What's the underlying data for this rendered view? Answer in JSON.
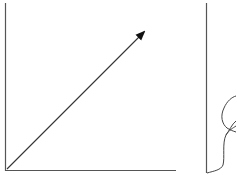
{
  "diagram": {
    "colors": {
      "axis": "#555555",
      "arrow": "#222222",
      "curve": "#444444",
      "background": "#ffffff"
    },
    "left_panel": {
      "y_axis": {
        "x": 5,
        "y1": 3,
        "y2": 171
      },
      "x_axis": {
        "y": 171,
        "x1": 5,
        "x2": 176
      },
      "vector_arrow": {
        "from": [
          7,
          169
        ],
        "to": [
          145,
          31
        ]
      }
    },
    "right_panel": {
      "vertical_line": {
        "x": 206,
        "y1": 3,
        "y2": 173
      },
      "curve": "loop curve starting near the line bottom, bending right and looping back"
    }
  }
}
